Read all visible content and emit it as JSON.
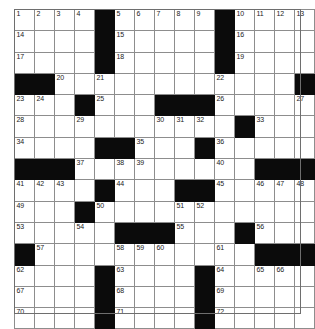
{
  "puzzle": {
    "type": "crossword-grid",
    "rows": 15,
    "columns": 15,
    "cell_colors": {
      "white": "#ffffff",
      "black": "#0b0b0b",
      "gridline": "#8d8d8d",
      "number_text": "#1a1a1a"
    },
    "grid": [
      [
        {
          "block": false,
          "number": "1"
        },
        {
          "block": false,
          "number": "2"
        },
        {
          "block": false,
          "number": "3"
        },
        {
          "block": false,
          "number": "4"
        },
        {
          "block": true,
          "number": ""
        },
        {
          "block": false,
          "number": "5"
        },
        {
          "block": false,
          "number": "6"
        },
        {
          "block": false,
          "number": "7"
        },
        {
          "block": false,
          "number": "8"
        },
        {
          "block": false,
          "number": "9"
        },
        {
          "block": true,
          "number": ""
        },
        {
          "block": false,
          "number": "10"
        },
        {
          "block": false,
          "number": "11"
        },
        {
          "block": false,
          "number": "12"
        },
        {
          "block": false,
          "number": "13"
        }
      ],
      [
        {
          "block": false,
          "number": "14"
        },
        {
          "block": false,
          "number": ""
        },
        {
          "block": false,
          "number": ""
        },
        {
          "block": false,
          "number": ""
        },
        {
          "block": true,
          "number": ""
        },
        {
          "block": false,
          "number": "15"
        },
        {
          "block": false,
          "number": ""
        },
        {
          "block": false,
          "number": ""
        },
        {
          "block": false,
          "number": ""
        },
        {
          "block": false,
          "number": ""
        },
        {
          "block": true,
          "number": ""
        },
        {
          "block": false,
          "number": "16"
        },
        {
          "block": false,
          "number": ""
        },
        {
          "block": false,
          "number": ""
        },
        {
          "block": false,
          "number": ""
        }
      ],
      [
        {
          "block": false,
          "number": "17"
        },
        {
          "block": false,
          "number": ""
        },
        {
          "block": false,
          "number": ""
        },
        {
          "block": false,
          "number": ""
        },
        {
          "block": true,
          "number": ""
        },
        {
          "block": false,
          "number": "18"
        },
        {
          "block": false,
          "number": ""
        },
        {
          "block": false,
          "number": ""
        },
        {
          "block": false,
          "number": ""
        },
        {
          "block": false,
          "number": ""
        },
        {
          "block": true,
          "number": ""
        },
        {
          "block": false,
          "number": "19"
        },
        {
          "block": false,
          "number": ""
        },
        {
          "block": false,
          "number": ""
        },
        {
          "block": false,
          "number": ""
        }
      ],
      [
        {
          "block": true,
          "number": ""
        },
        {
          "block": true,
          "number": ""
        },
        {
          "block": false,
          "number": "20"
        },
        {
          "block": false,
          "number": ""
        },
        {
          "block": false,
          "number": "21"
        },
        {
          "block": false,
          "number": ""
        },
        {
          "block": false,
          "number": ""
        },
        {
          "block": false,
          "number": ""
        },
        {
          "block": false,
          "number": ""
        },
        {
          "block": false,
          "number": ""
        },
        {
          "block": false,
          "number": "22"
        },
        {
          "block": false,
          "number": ""
        },
        {
          "block": false,
          "number": ""
        },
        {
          "block": false,
          "number": ""
        },
        {
          "block": true,
          "number": ""
        }
      ],
      [
        {
          "block": false,
          "number": "23"
        },
        {
          "block": false,
          "number": "24"
        },
        {
          "block": false,
          "number": ""
        },
        {
          "block": true,
          "number": ""
        },
        {
          "block": false,
          "number": "25"
        },
        {
          "block": false,
          "number": ""
        },
        {
          "block": false,
          "number": ""
        },
        {
          "block": true,
          "number": ""
        },
        {
          "block": true,
          "number": ""
        },
        {
          "block": true,
          "number": ""
        },
        {
          "block": false,
          "number": "26"
        },
        {
          "block": false,
          "number": ""
        },
        {
          "block": false,
          "number": ""
        },
        {
          "block": false,
          "number": ""
        },
        {
          "block": false,
          "number": "27"
        }
      ],
      [
        {
          "block": false,
          "number": "28"
        },
        {
          "block": false,
          "number": ""
        },
        {
          "block": false,
          "number": ""
        },
        {
          "block": false,
          "number": "29"
        },
        {
          "block": false,
          "number": ""
        },
        {
          "block": false,
          "number": ""
        },
        {
          "block": false,
          "number": ""
        },
        {
          "block": false,
          "number": "30"
        },
        {
          "block": false,
          "number": "31"
        },
        {
          "block": false,
          "number": "32"
        },
        {
          "block": false,
          "number": ""
        },
        {
          "block": true,
          "number": ""
        },
        {
          "block": false,
          "number": "33"
        },
        {
          "block": false,
          "number": ""
        },
        {
          "block": false,
          "number": ""
        }
      ],
      [
        {
          "block": false,
          "number": "34"
        },
        {
          "block": false,
          "number": ""
        },
        {
          "block": false,
          "number": ""
        },
        {
          "block": false,
          "number": ""
        },
        {
          "block": true,
          "number": ""
        },
        {
          "block": true,
          "number": ""
        },
        {
          "block": false,
          "number": "35"
        },
        {
          "block": false,
          "number": ""
        },
        {
          "block": false,
          "number": ""
        },
        {
          "block": true,
          "number": ""
        },
        {
          "block": false,
          "number": "36"
        },
        {
          "block": false,
          "number": ""
        },
        {
          "block": false,
          "number": ""
        },
        {
          "block": false,
          "number": ""
        },
        {
          "block": false,
          "number": ""
        }
      ],
      [
        {
          "block": true,
          "number": ""
        },
        {
          "block": true,
          "number": ""
        },
        {
          "block": true,
          "number": ""
        },
        {
          "block": false,
          "number": "37"
        },
        {
          "block": false,
          "number": ""
        },
        {
          "block": false,
          "number": "38"
        },
        {
          "block": false,
          "number": "39"
        },
        {
          "block": false,
          "number": ""
        },
        {
          "block": false,
          "number": ""
        },
        {
          "block": false,
          "number": ""
        },
        {
          "block": false,
          "number": "40"
        },
        {
          "block": false,
          "number": ""
        },
        {
          "block": true,
          "number": ""
        },
        {
          "block": true,
          "number": ""
        },
        {
          "block": true,
          "number": ""
        }
      ],
      [
        {
          "block": false,
          "number": "41"
        },
        {
          "block": false,
          "number": "42"
        },
        {
          "block": false,
          "number": "43"
        },
        {
          "block": false,
          "number": ""
        },
        {
          "block": true,
          "number": ""
        },
        {
          "block": false,
          "number": "44"
        },
        {
          "block": false,
          "number": ""
        },
        {
          "block": false,
          "number": ""
        },
        {
          "block": true,
          "number": ""
        },
        {
          "block": true,
          "number": ""
        },
        {
          "block": false,
          "number": "45"
        },
        {
          "block": false,
          "number": ""
        },
        {
          "block": false,
          "number": "46"
        },
        {
          "block": false,
          "number": "47"
        },
        {
          "block": false,
          "number": "48"
        }
      ],
      [
        {
          "block": false,
          "number": "49"
        },
        {
          "block": false,
          "number": ""
        },
        {
          "block": false,
          "number": ""
        },
        {
          "block": true,
          "number": ""
        },
        {
          "block": false,
          "number": "50"
        },
        {
          "block": false,
          "number": ""
        },
        {
          "block": false,
          "number": ""
        },
        {
          "block": false,
          "number": ""
        },
        {
          "block": false,
          "number": "51"
        },
        {
          "block": false,
          "number": "52"
        },
        {
          "block": false,
          "number": ""
        },
        {
          "block": false,
          "number": ""
        },
        {
          "block": false,
          "number": ""
        },
        {
          "block": false,
          "number": ""
        },
        {
          "block": false,
          "number": ""
        }
      ],
      [
        {
          "block": false,
          "number": "53"
        },
        {
          "block": false,
          "number": ""
        },
        {
          "block": false,
          "number": ""
        },
        {
          "block": false,
          "number": "54"
        },
        {
          "block": false,
          "number": ""
        },
        {
          "block": true,
          "number": ""
        },
        {
          "block": true,
          "number": ""
        },
        {
          "block": true,
          "number": ""
        },
        {
          "block": false,
          "number": "55"
        },
        {
          "block": false,
          "number": ""
        },
        {
          "block": false,
          "number": ""
        },
        {
          "block": true,
          "number": ""
        },
        {
          "block": false,
          "number": "56"
        },
        {
          "block": false,
          "number": ""
        },
        {
          "block": false,
          "number": ""
        }
      ],
      [
        {
          "block": true,
          "number": ""
        },
        {
          "block": false,
          "number": "57"
        },
        {
          "block": false,
          "number": ""
        },
        {
          "block": false,
          "number": ""
        },
        {
          "block": false,
          "number": ""
        },
        {
          "block": false,
          "number": "58"
        },
        {
          "block": false,
          "number": "59"
        },
        {
          "block": false,
          "number": "60"
        },
        {
          "block": false,
          "number": ""
        },
        {
          "block": false,
          "number": ""
        },
        {
          "block": false,
          "number": "61"
        },
        {
          "block": false,
          "number": ""
        },
        {
          "block": true,
          "number": ""
        },
        {
          "block": true,
          "number": ""
        },
        {
          "block": true,
          "number": ""
        }
      ],
      [
        {
          "block": false,
          "number": "62"
        },
        {
          "block": false,
          "number": ""
        },
        {
          "block": false,
          "number": ""
        },
        {
          "block": false,
          "number": ""
        },
        {
          "block": true,
          "number": ""
        },
        {
          "block": false,
          "number": "63"
        },
        {
          "block": false,
          "number": ""
        },
        {
          "block": false,
          "number": ""
        },
        {
          "block": false,
          "number": ""
        },
        {
          "block": true,
          "number": ""
        },
        {
          "block": false,
          "number": "64"
        },
        {
          "block": false,
          "number": ""
        },
        {
          "block": false,
          "number": "65"
        },
        {
          "block": false,
          "number": "66"
        },
        {
          "block": false,
          "number": ""
        }
      ],
      [
        {
          "block": false,
          "number": "67"
        },
        {
          "block": false,
          "number": ""
        },
        {
          "block": false,
          "number": ""
        },
        {
          "block": false,
          "number": ""
        },
        {
          "block": true,
          "number": ""
        },
        {
          "block": false,
          "number": "68"
        },
        {
          "block": false,
          "number": ""
        },
        {
          "block": false,
          "number": ""
        },
        {
          "block": false,
          "number": ""
        },
        {
          "block": true,
          "number": ""
        },
        {
          "block": false,
          "number": "69"
        },
        {
          "block": false,
          "number": ""
        },
        {
          "block": false,
          "number": ""
        },
        {
          "block": false,
          "number": ""
        },
        {
          "block": false,
          "number": ""
        }
      ],
      [
        {
          "block": false,
          "number": "70"
        },
        {
          "block": false,
          "number": ""
        },
        {
          "block": false,
          "number": ""
        },
        {
          "block": false,
          "number": ""
        },
        {
          "block": true,
          "number": ""
        },
        {
          "block": false,
          "number": "71"
        },
        {
          "block": false,
          "number": ""
        },
        {
          "block": false,
          "number": ""
        },
        {
          "block": false,
          "number": ""
        },
        {
          "block": true,
          "number": ""
        },
        {
          "block": false,
          "number": "72"
        },
        {
          "block": false,
          "number": ""
        },
        {
          "block": false,
          "number": ""
        },
        {
          "block": false,
          "number": ""
        },
        {
          "block": false,
          "number": ""
        }
      ]
    ]
  }
}
